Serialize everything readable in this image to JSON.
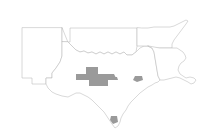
{
  "map": {
    "title": "South Central United States county highlight map",
    "background_color": "#ffffff",
    "border_color": "#b9b9b9",
    "highlight_color": "#9a9a9a",
    "projection_hint": "plate-carree",
    "region_label": "New Mexico, Oklahoma, Texas, Arkansas, Louisiana",
    "states": [
      {
        "name": "New Mexico",
        "abbr": "NM",
        "label": "New Mexico",
        "path": "M22,28 L22,78 L32,78 L32,84 L46,84 L46,78 L52,78 L52,73 L56,68 L60,62 L62,56 L62,28 Z"
      },
      {
        "name": "Oklahoma",
        "abbr": "OK",
        "label": "Oklahoma",
        "path": "M62,28 L62,42 L68,42 L70,42 L70,28 L104,28 L112,28 L128,28 L137,28 L137,38 L137,46 L136,52 L132,55 L127,55 L124,52 L120,54 L116,52 L112,54 L108,52 L104,54 L100,52 L96,54 L92,52 L88,53 L84,51 L80,52 L76,50 L73,47 L70,44 L68,42 Z"
      },
      {
        "name": "Texas",
        "abbr": "TX",
        "label": "Texas",
        "path": "M62,42 L62,56 L60,62 L56,68 L52,73 L52,78 L46,78 L46,84 L48,88 L52,92 L56,94 L62,96 L68,97 L72,95 L76,93 L80,93 L84,95 L88,97 L92,100 L96,104 L100,108 L104,112 L108,118 L112,124 L115,128 L118,126 L120,122 L121,118 L123,114 L126,110 L128,106 L131,102 L134,99 L137,96 L140,93 L144,90 L148,87 L152,85 L155,83 L158,82 L160,80 L158,76 L157,70 L156,64 L155,58 L154,52 L152,48 L148,46 L144,46 L140,48 L136,52 L132,55 L127,55 L124,52 L120,54 L116,52 L112,54 L108,52 L104,54 L100,52 L96,54 L92,52 L88,53 L84,51 L80,52 L76,50 L73,47 L70,44 L68,42 Z"
      },
      {
        "name": "Arkansas",
        "abbr": "AR",
        "label": "Arkansas",
        "path": "M137,28 L137,38 L137,46 L148,46 L152,48 L160,48 L172,48 L172,44 L174,40 L177,36 L180,32 L183,28 L186,24 L188,21 L186,20 L182,22 L178,24 L174,26 L170,27 L166,27 L160,27 L154,27 L148,28 L142,28 Z"
      },
      {
        "name": "Louisiana",
        "abbr": "LA",
        "label": "Louisiana",
        "path": "M148,46 L152,48 L154,52 L155,58 L156,64 L157,70 L158,76 L160,80 L164,80 L168,79 L172,78 L176,77 L180,78 L184,80 L188,82 L191,84 L194,83 L196,80 L194,78 L190,77 L186,78 L183,76 L180,74 L178,70 L179,66 L181,63 L184,61 L186,58 L185,55 L183,52 L180,50 L177,48 L174,48 L172,48 L166,48 L160,48 Z"
      }
    ],
    "highlighted_counties": [
      {
        "id": "permian-core-north",
        "label": "Permian Basin northern block",
        "path": "M86,67 L98,67 L98,74 L86,74 Z"
      },
      {
        "id": "permian-core-west",
        "label": "Permian Basin western block",
        "path": "M76,74 L98,74 L98,80 L76,80 Z"
      },
      {
        "id": "permian-core-east",
        "label": "Permian Basin eastern block",
        "path": "M98,74 L114,74 L116,78 L112,80 L98,80 Z"
      },
      {
        "id": "permian-core-south",
        "label": "Permian Basin southern block",
        "path": "M89,80 L108,80 L108,86 L89,86 Z"
      },
      {
        "id": "permian-spur-southwest",
        "label": "Permian Basin southwest spur",
        "path": "M82,76 L89,76 L89,80 L82,79 Z"
      },
      {
        "id": "permian-spur-east",
        "label": "Permian Basin east spur",
        "path": "M108,77 L117,77 L118,80 L108,80 Z"
      },
      {
        "id": "gulf-coast-county",
        "label": "Gulf Coast highlighted county",
        "path": "M135,76 L142,76 L143,80 L137,82 L133,80 Z"
      },
      {
        "id": "rio-grande-valley-county",
        "label": "Rio Grande Valley highlighted county",
        "path": "M111,116 L117,116 L118,122 L113,124 L110,120 Z"
      }
    ]
  },
  "legend": {
    "visible": false,
    "items": []
  }
}
